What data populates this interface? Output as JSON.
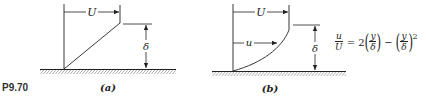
{
  "problem_label": "P9.70",
  "panels": [
    {
      "id": "a",
      "caption": "(a)",
      "free_stream_label": "U",
      "thickness_label": "δ",
      "profile": "linear"
    },
    {
      "id": "b",
      "caption": "(b)",
      "free_stream_label": "U",
      "local_velocity_label": "u",
      "thickness_label": "δ",
      "profile": "parabolic"
    }
  ],
  "equation": {
    "lhs_num": "u",
    "lhs_den": "U",
    "equals": "=",
    "coef": "2",
    "frac_num": "y",
    "frac_den": "δ",
    "minus": "−",
    "frac2_num": "y",
    "frac2_den": "δ",
    "exponent": "2"
  },
  "colors": {
    "ink": "#222222",
    "background": "#ffffff"
  }
}
